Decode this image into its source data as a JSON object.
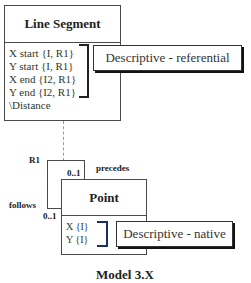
{
  "diagram": {
    "classes": [
      {
        "name": "Line Segment",
        "attributes": [
          "X start  {I, R1}",
          "Y start  {I, R1}",
          "X end  {I2, R1}",
          "Y end  {I2, R1}",
          "\\Distance"
        ]
      },
      {
        "name": "Point",
        "attributes": [
          "X  {I}",
          "Y  {I}"
        ]
      }
    ],
    "notes": [
      {
        "text": "Descriptive - referential",
        "attaches_to": "Line Segment attributes"
      },
      {
        "text": "Descriptive - native",
        "attaches_to": "Point attributes"
      }
    ],
    "relationship": {
      "id": "R1",
      "type": "reflexive",
      "class": "Point",
      "phrase_a": "precedes",
      "multiplicity_a": "0..1",
      "phrase_b": "follows",
      "multiplicity_b": "0..1",
      "association_class": "Line Segment"
    },
    "caption": "Model 3.X"
  }
}
